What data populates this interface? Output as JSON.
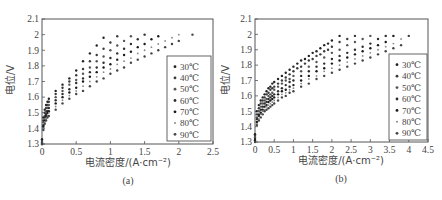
{
  "chart_data": [
    {
      "id": "a",
      "type": "scatter",
      "caption": "(a)",
      "xlabel": "电流密度/(A·cm⁻²)",
      "ylabel": "电位/V",
      "xlim": [
        0,
        2.5
      ],
      "ylim": [
        1.3,
        2.1
      ],
      "xticks": [
        "0",
        "0.5",
        "1",
        "1.5",
        "2",
        "2.5"
      ],
      "yticks": [
        "1.3",
        "1.4",
        "1.5",
        "1.6",
        "1.7",
        "1.8",
        "1.9",
        "2",
        "2.1"
      ],
      "grid": false,
      "legend_position": "lower right",
      "series": [
        {
          "name": "30℃",
          "x": [
            0,
            0.02,
            0.04,
            0.06,
            0.08,
            0.1,
            0.2,
            0.3,
            0.4,
            0.5,
            0.6,
            0.7,
            0.8,
            0.9
          ],
          "y": [
            1.33,
            1.47,
            1.52,
            1.55,
            1.57,
            1.59,
            1.64,
            1.68,
            1.72,
            1.77,
            1.83,
            1.88,
            1.93,
            1.98
          ]
        },
        {
          "name": "40℃",
          "x": [
            0,
            0.02,
            0.04,
            0.06,
            0.08,
            0.1,
            0.2,
            0.3,
            0.4,
            0.5,
            0.6,
            0.7,
            0.8,
            0.9,
            1.0,
            1.1
          ],
          "y": [
            1.32,
            1.45,
            1.5,
            1.53,
            1.55,
            1.57,
            1.62,
            1.66,
            1.7,
            1.74,
            1.78,
            1.83,
            1.87,
            1.91,
            1.95,
            1.99
          ]
        },
        {
          "name": "50℃",
          "x": [
            0,
            0.02,
            0.04,
            0.06,
            0.08,
            0.1,
            0.2,
            0.3,
            0.4,
            0.5,
            0.6,
            0.7,
            0.8,
            0.9,
            1.0,
            1.1,
            1.2,
            1.3
          ],
          "y": [
            1.31,
            1.44,
            1.48,
            1.51,
            1.53,
            1.55,
            1.6,
            1.64,
            1.68,
            1.71,
            1.75,
            1.79,
            1.83,
            1.86,
            1.9,
            1.93,
            1.96,
            1.99
          ]
        },
        {
          "name": "60℃",
          "x": [
            0,
            0.02,
            0.04,
            0.06,
            0.08,
            0.1,
            0.2,
            0.3,
            0.4,
            0.5,
            0.6,
            0.7,
            0.8,
            0.9,
            1.0,
            1.1,
            1.2,
            1.3,
            1.4,
            1.5
          ],
          "y": [
            1.3,
            1.42,
            1.47,
            1.49,
            1.51,
            1.53,
            1.58,
            1.62,
            1.65,
            1.69,
            1.72,
            1.76,
            1.79,
            1.82,
            1.85,
            1.88,
            1.91,
            1.94,
            1.97,
            2.0
          ]
        },
        {
          "name": "70℃",
          "x": [
            0,
            0.02,
            0.04,
            0.06,
            0.08,
            0.1,
            0.2,
            0.3,
            0.4,
            0.5,
            0.6,
            0.7,
            0.8,
            0.9,
            1.0,
            1.1,
            1.2,
            1.3,
            1.4,
            1.5,
            1.6,
            1.7
          ],
          "y": [
            1.3,
            1.41,
            1.45,
            1.48,
            1.5,
            1.51,
            1.56,
            1.6,
            1.63,
            1.66,
            1.7,
            1.73,
            1.76,
            1.79,
            1.81,
            1.84,
            1.87,
            1.89,
            1.92,
            1.94,
            1.97,
            1.99
          ]
        },
        {
          "name": "80℃",
          "x": [
            0,
            0.02,
            0.04,
            0.06,
            0.08,
            0.1,
            0.2,
            0.3,
            0.4,
            0.5,
            0.6,
            0.7,
            0.8,
            0.9,
            1.0,
            1.1,
            1.2,
            1.3,
            1.4,
            1.5,
            1.6,
            1.7,
            1.8,
            1.9,
            2.0
          ],
          "y": [
            1.3,
            1.4,
            1.44,
            1.46,
            1.48,
            1.5,
            1.54,
            1.58,
            1.61,
            1.64,
            1.67,
            1.7,
            1.73,
            1.76,
            1.78,
            1.81,
            1.83,
            1.85,
            1.88,
            1.9,
            1.92,
            1.94,
            1.96,
            1.98,
            2.0
          ]
        },
        {
          "name": "90℃",
          "x": [
            0,
            0.02,
            0.04,
            0.06,
            0.08,
            0.1,
            0.2,
            0.3,
            0.4,
            0.5,
            0.6,
            0.7,
            0.8,
            0.9,
            1.0,
            1.1,
            1.2,
            1.3,
            1.4,
            1.5,
            1.6,
            1.7,
            1.8,
            1.9,
            2.0,
            2.2
          ],
          "y": [
            1.3,
            1.39,
            1.43,
            1.45,
            1.47,
            1.48,
            1.52,
            1.56,
            1.59,
            1.62,
            1.64,
            1.67,
            1.7,
            1.72,
            1.75,
            1.77,
            1.79,
            1.82,
            1.84,
            1.86,
            1.88,
            1.9,
            1.92,
            1.94,
            1.96,
            2.0
          ]
        }
      ]
    },
    {
      "id": "b",
      "type": "scatter",
      "caption": "(b)",
      "xlabel": "电流密度/(A·cm⁻²)",
      "ylabel": "电位/V",
      "xlim": [
        0,
        4.5
      ],
      "ylim": [
        1.3,
        2.1
      ],
      "xticks": [
        "0",
        "0.5",
        "1",
        "1.5",
        "2",
        "2.5",
        "3",
        "3.5",
        "4",
        "4.5"
      ],
      "yticks": [
        "1.3",
        "1.4",
        "1.5",
        "1.6",
        "1.7",
        "1.8",
        "1.9",
        "2",
        "2.1"
      ],
      "grid": false,
      "legend_position": "lower right",
      "series": [
        {
          "name": "30℃",
          "x": [
            0,
            0.05,
            0.1,
            0.15,
            0.2,
            0.25,
            0.3,
            0.35,
            0.4,
            0.45,
            0.5,
            0.6,
            0.7,
            0.8,
            0.9,
            1.0,
            1.1,
            1.2,
            1.3,
            1.4,
            1.5,
            1.6,
            1.7,
            1.8,
            1.9,
            2.0,
            2.2
          ],
          "y": [
            1.35,
            1.5,
            1.54,
            1.57,
            1.59,
            1.61,
            1.63,
            1.65,
            1.66,
            1.68,
            1.69,
            1.71,
            1.73,
            1.75,
            1.77,
            1.79,
            1.81,
            1.83,
            1.84,
            1.86,
            1.88,
            1.89,
            1.91,
            1.93,
            1.94,
            1.96,
            1.99
          ]
        },
        {
          "name": "40℃",
          "x": [
            0,
            0.05,
            0.1,
            0.15,
            0.2,
            0.25,
            0.3,
            0.35,
            0.4,
            0.45,
            0.5,
            0.6,
            0.7,
            0.8,
            0.9,
            1.0,
            1.1,
            1.2,
            1.3,
            1.4,
            1.5,
            1.6,
            1.7,
            1.8,
            1.9,
            2.0,
            2.2,
            2.4,
            2.6
          ],
          "y": [
            1.34,
            1.48,
            1.52,
            1.55,
            1.57,
            1.59,
            1.61,
            1.62,
            1.64,
            1.65,
            1.66,
            1.68,
            1.7,
            1.72,
            1.74,
            1.76,
            1.78,
            1.79,
            1.81,
            1.83,
            1.84,
            1.86,
            1.87,
            1.89,
            1.9,
            1.92,
            1.95,
            1.97,
            1.99
          ]
        },
        {
          "name": "50℃",
          "x": [
            0,
            0.05,
            0.1,
            0.15,
            0.2,
            0.25,
            0.3,
            0.35,
            0.4,
            0.45,
            0.5,
            0.6,
            0.7,
            0.8,
            0.9,
            1.0,
            1.2,
            1.4,
            1.6,
            1.8,
            2.0,
            2.2,
            2.4,
            2.6,
            2.8,
            3.0
          ],
          "y": [
            1.33,
            1.46,
            1.5,
            1.53,
            1.55,
            1.57,
            1.58,
            1.6,
            1.61,
            1.62,
            1.64,
            1.66,
            1.68,
            1.7,
            1.71,
            1.73,
            1.76,
            1.79,
            1.82,
            1.85,
            1.88,
            1.9,
            1.93,
            1.95,
            1.97,
            1.99
          ]
        },
        {
          "name": "60℃",
          "x": [
            0,
            0.05,
            0.1,
            0.15,
            0.2,
            0.25,
            0.3,
            0.35,
            0.4,
            0.45,
            0.5,
            0.6,
            0.7,
            0.8,
            0.9,
            1.0,
            1.2,
            1.4,
            1.6,
            1.8,
            2.0,
            2.2,
            2.4,
            2.6,
            2.8,
            3.0,
            3.2,
            3.4
          ],
          "y": [
            1.32,
            1.45,
            1.48,
            1.51,
            1.53,
            1.55,
            1.56,
            1.58,
            1.59,
            1.6,
            1.61,
            1.63,
            1.65,
            1.67,
            1.69,
            1.7,
            1.73,
            1.76,
            1.79,
            1.81,
            1.84,
            1.86,
            1.88,
            1.9,
            1.92,
            1.94,
            1.97,
            1.99
          ]
        },
        {
          "name": "70℃",
          "x": [
            0,
            0.05,
            0.1,
            0.15,
            0.2,
            0.25,
            0.3,
            0.35,
            0.4,
            0.45,
            0.5,
            0.6,
            0.7,
            0.8,
            0.9,
            1.0,
            1.2,
            1.4,
            1.6,
            1.8,
            2.0,
            2.2,
            2.4,
            2.6,
            2.8,
            3.0,
            3.2,
            3.4,
            3.6
          ],
          "y": [
            1.31,
            1.43,
            1.47,
            1.49,
            1.51,
            1.53,
            1.54,
            1.56,
            1.57,
            1.58,
            1.59,
            1.61,
            1.63,
            1.64,
            1.66,
            1.67,
            1.7,
            1.73,
            1.76,
            1.78,
            1.81,
            1.83,
            1.85,
            1.87,
            1.89,
            1.91,
            1.93,
            1.95,
            1.99
          ]
        },
        {
          "name": "80℃",
          "x": [
            0,
            0.05,
            0.1,
            0.15,
            0.2,
            0.25,
            0.3,
            0.35,
            0.4,
            0.45,
            0.5,
            0.6,
            0.7,
            0.8,
            0.9,
            1.0,
            1.2,
            1.4,
            1.6,
            1.8,
            2.0,
            2.2,
            2.4,
            2.6,
            2.8,
            3.0,
            3.2,
            3.4,
            3.6,
            3.8
          ],
          "y": [
            1.3,
            1.42,
            1.45,
            1.48,
            1.5,
            1.51,
            1.53,
            1.54,
            1.55,
            1.56,
            1.57,
            1.59,
            1.61,
            1.62,
            1.64,
            1.65,
            1.68,
            1.71,
            1.73,
            1.76,
            1.78,
            1.8,
            1.82,
            1.84,
            1.86,
            1.88,
            1.9,
            1.92,
            1.94,
            1.97
          ]
        },
        {
          "name": "90℃",
          "x": [
            0,
            0.05,
            0.1,
            0.15,
            0.2,
            0.25,
            0.3,
            0.35,
            0.4,
            0.45,
            0.5,
            0.6,
            0.7,
            0.8,
            0.9,
            1.0,
            1.2,
            1.4,
            1.6,
            1.8,
            2.0,
            2.2,
            2.4,
            2.6,
            2.8,
            3.0,
            3.2,
            3.4,
            3.6,
            3.8,
            4.0
          ],
          "y": [
            1.3,
            1.41,
            1.44,
            1.46,
            1.48,
            1.5,
            1.51,
            1.52,
            1.53,
            1.54,
            1.55,
            1.57,
            1.59,
            1.6,
            1.62,
            1.63,
            1.66,
            1.68,
            1.71,
            1.73,
            1.75,
            1.77,
            1.79,
            1.81,
            1.83,
            1.85,
            1.87,
            1.89,
            1.91,
            1.93,
            1.99
          ]
        }
      ]
    }
  ],
  "layout": {
    "panels": [
      {
        "plot": {
          "left": 42,
          "top": 19,
          "right": 213,
          "bottom": 144
        },
        "legend": {
          "left": 167,
          "top": 56,
          "right": 211,
          "bottom": 141
        },
        "xlabel_pos": [
          128,
          166
        ],
        "caption_pos": [
          128,
          184
        ],
        "ylabel_pos": [
          14,
          80
        ]
      },
      {
        "plot": {
          "left": 255,
          "top": 19,
          "right": 428,
          "bottom": 142
        },
        "legend": {
          "left": 389,
          "top": 54,
          "right": 427,
          "bottom": 140
        },
        "xlabel_pos": [
          341,
          164
        ],
        "caption_pos": [
          341,
          182
        ],
        "ylabel_pos": [
          229,
          80
        ]
      }
    ],
    "series_colors": [
      "#222222",
      "#3a3a3a",
      "#555555",
      "#2e2e2e",
      "#1a1a1a",
      "#888888",
      "#444444"
    ],
    "axis_color": "#555555"
  }
}
